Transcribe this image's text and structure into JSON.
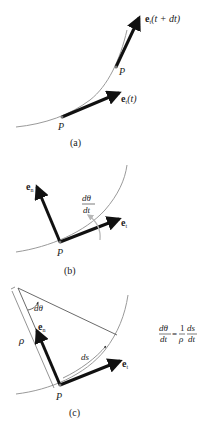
{
  "panels": {
    "a": {
      "caption": "(a)",
      "labels": {
        "et_t_bold": "e",
        "et_t_sub": "t",
        "et_t_arg": "(t)",
        "et_tdt_bold": "e",
        "et_tdt_sub": "t",
        "et_tdt_arg": "(t + dt)",
        "p_lower": "P",
        "p_upper": "P"
      }
    },
    "b": {
      "caption": "(b)",
      "labels": {
        "en_bold": "e",
        "en_sub": "n",
        "et_bold": "e",
        "et_sub": "t",
        "dtheta_num": "dθ",
        "dtheta_den": "dt",
        "p": "P"
      }
    },
    "c": {
      "caption": "(c)",
      "labels": {
        "en_bold": "e",
        "en_sub": "n",
        "et_bold": "e",
        "et_sub": "t",
        "rho": "ρ",
        "dtheta": "dθ",
        "ds": "ds",
        "p": "P"
      },
      "equation": {
        "lhs_num": "dθ",
        "lhs_den": "dt",
        "equals": "=",
        "one": "1",
        "rho": "ρ",
        "rhs_num": "ds",
        "rhs_den": "dt"
      }
    }
  },
  "colors": {
    "arrow": "#111111",
    "curve": "#9a9a9a",
    "rotation_arrow": "#b8b8b8",
    "text": "#222222"
  }
}
